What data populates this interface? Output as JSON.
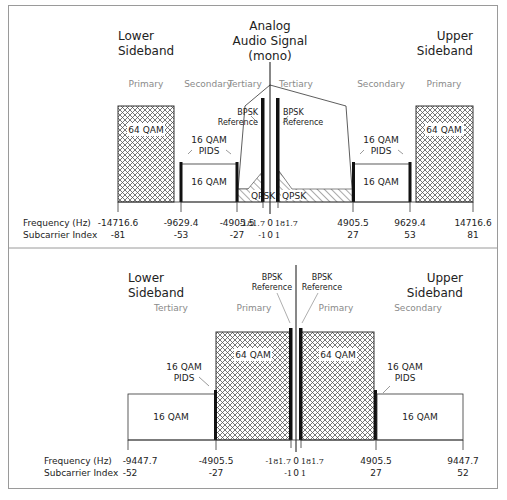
{
  "top": {
    "lower_sideband": [
      "Lower",
      "Sideband"
    ],
    "upper_sideband": [
      "Upper",
      "Sideband"
    ],
    "analog": [
      "Analog",
      "Audio Signal",
      "(mono)"
    ],
    "regions": {
      "lower_primary": "Primary",
      "lower_secondary": "Secondary",
      "lower_tertiary": "Tertiary",
      "upper_tertiary": "Tertiary",
      "upper_secondary": "Secondary",
      "upper_primary": "Primary"
    },
    "boxes": {
      "lower_64qam": "64 QAM",
      "lower_16qam": "16 QAM",
      "upper_16qam": "16 QAM",
      "upper_64qam": "64 QAM",
      "lower_qpsk": "QPSK",
      "upper_qpsk": "QPSK"
    },
    "pids_lower": [
      "16 QAM",
      "PIDS"
    ],
    "pids_upper": [
      "16 QAM",
      "PIDS"
    ],
    "bpsk_lower": [
      "BPSK",
      "Reference"
    ],
    "bpsk_upper": [
      "BPSK",
      "Reference"
    ],
    "axis_labels": [
      "Frequency (Hz)",
      "Subcarrier Index"
    ],
    "ticks": [
      {
        "freq": "-14716.6",
        "idx": "-81"
      },
      {
        "freq": "-9629.4",
        "idx": "-53"
      },
      {
        "freq": "-4905.5",
        "idx": "-27"
      },
      {
        "freq": "-181.7",
        "idx": "-1"
      },
      {
        "freq": "0",
        "idx": "0"
      },
      {
        "freq": "181.7",
        "idx": "1"
      },
      {
        "freq": "4905.5",
        "idx": "27"
      },
      {
        "freq": "9629.4",
        "idx": "53"
      },
      {
        "freq": "14716.6",
        "idx": "81"
      }
    ]
  },
  "bottom": {
    "lower_sideband": [
      "Lower",
      "Sideband"
    ],
    "upper_sideband": [
      "Upper",
      "Sideband"
    ],
    "regions": {
      "lower_tertiary": "Tertiary",
      "lower_primary": "Primary",
      "upper_primary": "Primary",
      "upper_secondary": "Secondary"
    },
    "boxes": {
      "lower_16qam": "16 QAM",
      "lower_64qam": "64 QAM",
      "upper_64qam": "64 QAM",
      "upper_16qam": "16 QAM"
    },
    "pids_lower": [
      "16 QAM",
      "PIDS"
    ],
    "pids_upper": [
      "16 QAM",
      "PIDS"
    ],
    "bpsk_lower": [
      "BPSK",
      "Reference"
    ],
    "bpsk_upper": [
      "BPSK",
      "Reference"
    ],
    "axis_labels": [
      "Frequency (Hz)",
      "Subcarrier Index"
    ],
    "ticks": [
      {
        "freq": "-9447.7",
        "idx": "-52"
      },
      {
        "freq": "-4905.5",
        "idx": "-27"
      },
      {
        "freq": "-181.7",
        "idx": "-1"
      },
      {
        "freq": "0",
        "idx": "0"
      },
      {
        "freq": "181.7",
        "idx": "1"
      },
      {
        "freq": "4905.5",
        "idx": "27"
      },
      {
        "freq": "9447.7",
        "idx": "52"
      }
    ]
  }
}
